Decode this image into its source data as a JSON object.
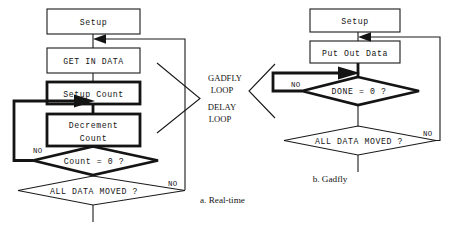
{
  "figure": {
    "width": 452,
    "height": 241,
    "background": "#ffffff",
    "line_color": "#141414",
    "node_fill": "#f2f2f0"
  },
  "center_labels": {
    "gadfly_line1": "GADFLY",
    "gadfly_line2": "LOOP",
    "delay_line1": "DELAY",
    "delay_line2": "LOOP"
  },
  "left_chart": {
    "caption": "a. Real-time",
    "nodes": {
      "setup": "Setup",
      "get_in_data": "GET IN DATA",
      "setup_count": "Setup Count",
      "decrement_line1": "Decrement",
      "decrement_line2": "Count",
      "count_check": "Count = 0 ?",
      "all_data_moved": "ALL DATA MOVED ?"
    },
    "edge_labels": {
      "count_no": "NO",
      "all_data_no": "NO"
    }
  },
  "right_chart": {
    "caption": "b. Gadfly",
    "nodes": {
      "setup": "Setup",
      "put_out_data": "Put Out Data",
      "done_check": "DONE = 0 ?",
      "all_data_moved": "ALL DATA MOVED ?"
    },
    "edge_labels": {
      "done_no": "NO",
      "all_data_no": "NO"
    }
  }
}
